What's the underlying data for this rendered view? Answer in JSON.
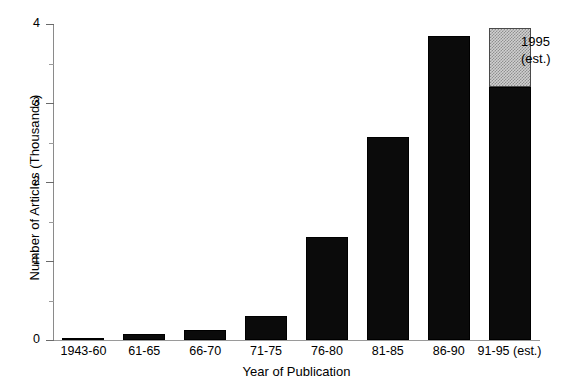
{
  "chart_data": {
    "type": "bar",
    "title": "",
    "xlabel": "Year of Publication",
    "ylabel": "Number of Articles  (Thousands)",
    "categories": [
      "1943-60",
      "61-65",
      "66-70",
      "71-75",
      "76-80",
      "81-85",
      "86-90",
      "91-95 (est.)"
    ],
    "values": [
      0.03,
      0.07,
      0.13,
      0.3,
      1.3,
      2.57,
      3.85,
      3.95
    ],
    "series": [
      {
        "name": "Published articles",
        "values": [
          0.03,
          0.07,
          0.13,
          0.3,
          1.3,
          2.57,
          3.85,
          3.2
        ]
      },
      {
        "name": "1995 (est.)",
        "values": [
          0,
          0,
          0,
          0,
          0,
          0,
          0,
          0.75
        ]
      }
    ],
    "ylim": [
      0,
      4
    ],
    "yticks": [
      0,
      1,
      2,
      3,
      4
    ],
    "ytick_labels": [
      "0",
      "1",
      "2",
      "3",
      "4"
    ],
    "yminor_ticks": [
      0.5,
      1.5,
      2.5,
      3.5
    ],
    "grid": false,
    "legend_position": "none",
    "annotations": [
      {
        "text_line1": "1995",
        "text_line2": "(est.)",
        "target_category": "91-95 (est.)"
      }
    ],
    "colors": {
      "bar_solid": "#0b0b0b",
      "bar_estimate": "#c8c8c8",
      "axis": "#8a8a8a",
      "text": "#000000",
      "background": "#ffffff"
    }
  }
}
